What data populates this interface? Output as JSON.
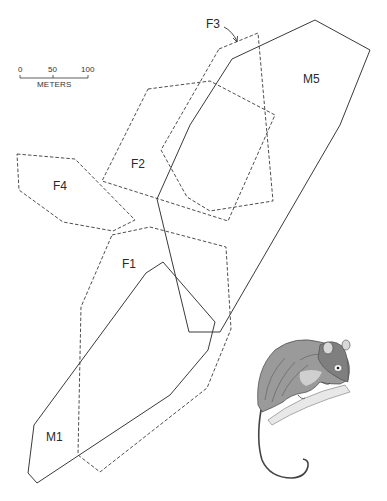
{
  "figure": {
    "type": "home-range map",
    "scale_bar": {
      "ticks": [
        "0",
        "50",
        "100"
      ],
      "unit": "METERS"
    },
    "ranges": [
      {
        "id": "M5",
        "label": "M5",
        "sex": "male",
        "line": "solid",
        "points": [
          [
            232,
            59
          ],
          [
            315,
            20
          ],
          [
            370,
            50
          ],
          [
            340,
            125
          ],
          [
            220,
            332
          ],
          [
            189,
            332
          ],
          [
            157,
            199
          ],
          [
            190,
            125
          ]
        ]
      },
      {
        "id": "M1",
        "label": "M1",
        "sex": "male",
        "line": "solid",
        "points": [
          [
            146,
            273
          ],
          [
            163,
            262
          ],
          [
            215,
            322
          ],
          [
            208,
            350
          ],
          [
            170,
            395
          ],
          [
            37,
            483
          ],
          [
            28,
            473
          ],
          [
            34,
            425
          ]
        ]
      },
      {
        "id": "F1",
        "label": "F1",
        "sex": "female",
        "line": "dashed",
        "points": [
          [
            112,
            235
          ],
          [
            150,
            227
          ],
          [
            226,
            247
          ],
          [
            231,
            329
          ],
          [
            207,
            388
          ],
          [
            100,
            472
          ],
          [
            78,
            455
          ],
          [
            81,
            307
          ]
        ]
      },
      {
        "id": "F2",
        "label": "F2",
        "sex": "female",
        "line": "dashed",
        "points": [
          [
            148,
            89
          ],
          [
            210,
            81
          ],
          [
            275,
            115
          ],
          [
            228,
            221
          ],
          [
            102,
            181
          ]
        ]
      },
      {
        "id": "F3",
        "label": "F3",
        "sex": "female",
        "line": "dashed",
        "points": [
          [
            219,
            49
          ],
          [
            258,
            33
          ],
          [
            273,
            201
          ],
          [
            210,
            211
          ],
          [
            187,
            197
          ],
          [
            161,
            150
          ]
        ]
      },
      {
        "id": "F4",
        "label": "F4",
        "sex": "female",
        "line": "dashed",
        "points": [
          [
            17,
            154
          ],
          [
            75,
            159
          ],
          [
            135,
            220
          ],
          [
            113,
            231
          ],
          [
            63,
            222
          ],
          [
            19,
            190
          ]
        ]
      }
    ],
    "illustration": "possum-on-branch",
    "colors": {
      "line": "#3a3a3a",
      "text": "#2a2a2a",
      "background": "#ffffff"
    }
  }
}
